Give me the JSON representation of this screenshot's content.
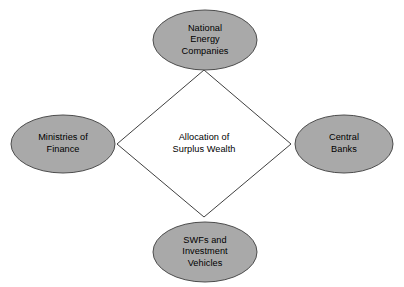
{
  "diagram": {
    "type": "hub-and-spoke",
    "background_color": "#ffffff",
    "center": {
      "shape": "diamond",
      "fill_color": "#ffffff",
      "stroke_color": "#404040",
      "lines": [
        "Allocation of",
        "Surplus Wealth"
      ],
      "text": "Allocation of Surplus Wealth"
    },
    "nodes": [
      {
        "id": "national-energy-companies",
        "position": "top",
        "shape": "ellipse",
        "fill_color": "#a9a9a9",
        "stroke_color": "#4d4d4d",
        "lines": [
          "National",
          "Energy",
          "Companies"
        ],
        "text": "National Energy Companies"
      },
      {
        "id": "ministries-of-finance",
        "position": "left",
        "shape": "ellipse",
        "fill_color": "#a9a9a9",
        "stroke_color": "#4d4d4d",
        "lines": [
          "Ministries of",
          "Finance"
        ],
        "text": "Ministries of Finance"
      },
      {
        "id": "central-banks",
        "position": "right",
        "shape": "ellipse",
        "fill_color": "#a9a9a9",
        "stroke_color": "#4d4d4d",
        "lines": [
          "Central",
          "Banks"
        ],
        "text": "Central Banks"
      },
      {
        "id": "swfs-investment-vehicles",
        "position": "bottom",
        "shape": "ellipse",
        "fill_color": "#a9a9a9",
        "stroke_color": "#4d4d4d",
        "lines": [
          "SWFs and",
          "Investment",
          "Vehicles"
        ],
        "text": "SWFs and Investment Vehicles"
      }
    ]
  }
}
